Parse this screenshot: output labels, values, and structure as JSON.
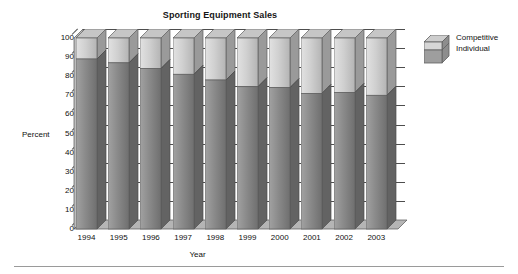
{
  "chart_data": {
    "type": "bar",
    "subtype": "stacked-3d-column",
    "title": "Sporting Equipment Sales",
    "xlabel": "Year",
    "ylabel": "Percent",
    "categories": [
      "1994",
      "1995",
      "1996",
      "1997",
      "1998",
      "1999",
      "2000",
      "2001",
      "2002",
      "2003"
    ],
    "series": [
      {
        "name": "Individual",
        "values": [
          89,
          87,
          84,
          81,
          78,
          74.5,
          74,
          71,
          71.5,
          70
        ]
      },
      {
        "name": "Competitive",
        "values": [
          11,
          13,
          16,
          19,
          22,
          25.5,
          26,
          29,
          28.5,
          30
        ]
      }
    ],
    "ylim": [
      0,
      100
    ],
    "yticks": [
      0,
      10,
      20,
      30,
      40,
      50,
      60,
      70,
      80,
      90,
      100
    ],
    "ytick_labels": [
      "0",
      "10",
      "20",
      "30",
      "40",
      "50",
      "60",
      "70",
      "80",
      "90",
      "100"
    ],
    "grid": true,
    "legend_position": "right",
    "colors": {
      "individual": "#8a8a8a",
      "competitive": "#cfcfcf",
      "axis": "#4d4d4d",
      "text": "#111111",
      "background": "#ffffff"
    }
  },
  "legend": {
    "entries": [
      {
        "label": "Competitive"
      },
      {
        "label": "Individual"
      }
    ]
  }
}
